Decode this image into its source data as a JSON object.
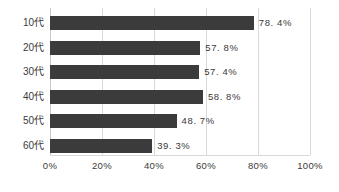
{
  "chart_data": {
    "type": "bar",
    "orientation": "horizontal",
    "title": "",
    "xlabel": "",
    "ylabel": "",
    "categories": [
      "10代",
      "20代",
      "30代",
      "40代",
      "50代",
      "60代"
    ],
    "values": [
      78.4,
      57.8,
      57.4,
      58.8,
      48.7,
      39.3
    ],
    "value_labels": [
      "78. 4%",
      "57. 8%",
      "57. 4%",
      "58. 8%",
      "48. 7%",
      "39. 3%"
    ],
    "xlim": [
      0,
      100
    ],
    "xticks": [
      0,
      20,
      40,
      60,
      80,
      100
    ],
    "xtick_labels": [
      "0%",
      "20%",
      "40%",
      "60%",
      "80%",
      "100%"
    ],
    "grid": true,
    "grid_axis": "x",
    "legend": false,
    "colors": {
      "bar": "#3b3b3b",
      "grid": "#d9d9d9",
      "text": "#3a3a3a",
      "background": "#ffffff"
    }
  }
}
